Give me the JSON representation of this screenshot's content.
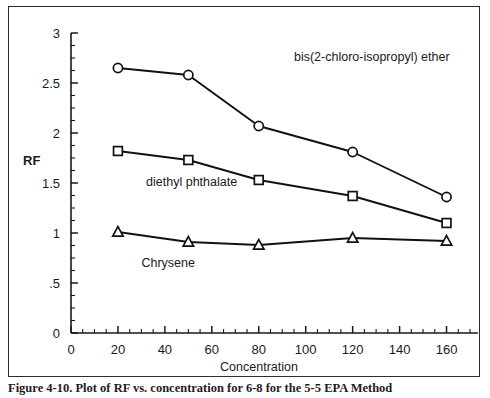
{
  "figure": {
    "caption_partial": "Figure 4-10.  Plot of RF vs. concentration for 6-8 for the 5-5 EPA Method",
    "border_color": "#2b2b2b"
  },
  "chart_data": {
    "type": "line",
    "title": "",
    "xlabel": "Concentration",
    "ylabel": "RF",
    "xlim": [
      0,
      170
    ],
    "ylim": [
      0,
      3
    ],
    "grid": false,
    "legend_position": "inline-annotations",
    "x_ticks": [
      0,
      20,
      40,
      60,
      80,
      100,
      120,
      140,
      160
    ],
    "x_tick_labels": [
      "0",
      "20",
      "40",
      "60",
      "80",
      "100",
      "120",
      "140",
      "160"
    ],
    "x_minor_tick_interval": 5,
    "y_ticks": [
      0,
      0.5,
      1,
      1.5,
      2,
      2.5,
      3
    ],
    "y_tick_labels": [
      "0",
      ".5",
      "1",
      "1.5",
      "2",
      "2.5",
      "3"
    ],
    "y_minor_tick_interval": 0.125,
    "x": [
      20,
      50,
      80,
      120,
      160
    ],
    "series": [
      {
        "name": "bis(2-chloro-isopropyl) ether",
        "marker": "circle",
        "values": [
          2.65,
          2.58,
          2.07,
          1.81,
          1.36
        ],
        "label_x": 95,
        "label_y": 2.72,
        "color": "#111111"
      },
      {
        "name": "diethyl phthalate",
        "marker": "square",
        "values": [
          1.82,
          1.73,
          1.53,
          1.37,
          1.1
        ],
        "label_x": 32,
        "label_y": 1.47,
        "color": "#111111"
      },
      {
        "name": "Chrysene",
        "marker": "triangle",
        "values": [
          1.01,
          0.91,
          0.88,
          0.95,
          0.92
        ],
        "label_x": 30,
        "label_y": 0.66,
        "color": "#111111"
      }
    ]
  }
}
